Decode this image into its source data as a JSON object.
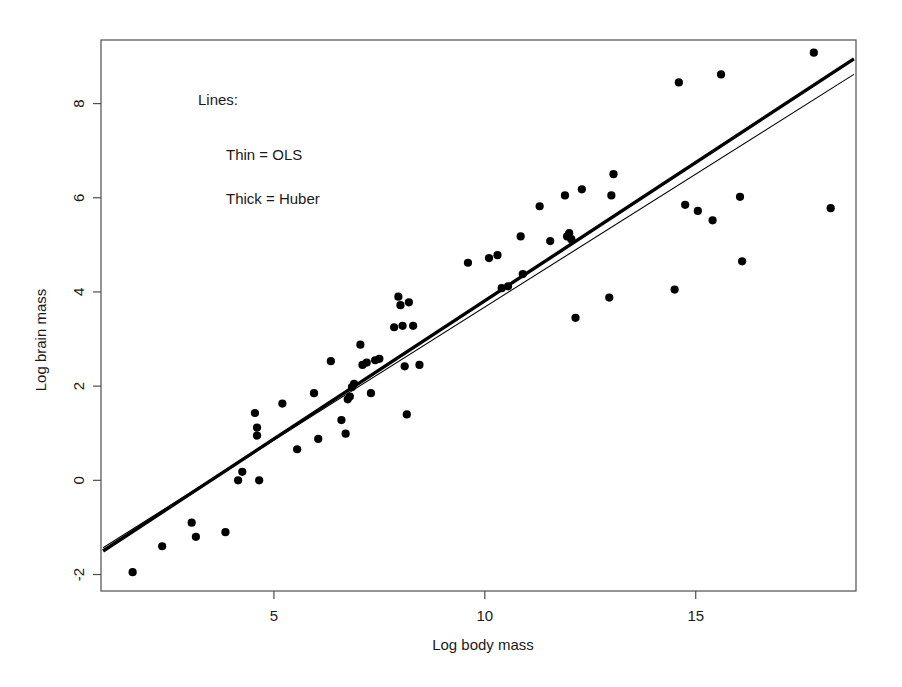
{
  "figure": {
    "background_color": "#ffffff",
    "frame_color": "#4d4d4d",
    "point_color": "#000000",
    "line_color": "#000000"
  },
  "annotations": {
    "heading": "Lines:",
    "line_thin": "Thin = OLS",
    "line_thick": "Thick = Huber"
  },
  "chart_data": {
    "type": "scatter",
    "title": "",
    "xlabel": "Log body mass",
    "ylabel": "Log brain mass",
    "xlim": [
      0.9,
      18.8
    ],
    "ylim": [
      -2.35,
      9.35
    ],
    "xticks": [
      5,
      10,
      15
    ],
    "yticks": [
      -2,
      0,
      2,
      4,
      6,
      8
    ],
    "xtick_labels": [
      "5",
      "10",
      "15"
    ],
    "ytick_labels": [
      "-2",
      "0",
      "2",
      "4",
      "6",
      "8"
    ],
    "grid": false,
    "legend": "annotation-text-upper-left",
    "point_marker": "filled-circle",
    "n_points": 62,
    "x": [
      1.65,
      2.35,
      3.05,
      3.15,
      3.85,
      4.15,
      4.25,
      4.55,
      4.6,
      4.6,
      4.65,
      5.2,
      5.55,
      5.95,
      6.05,
      6.35,
      6.6,
      6.7,
      6.75,
      6.8,
      6.85,
      6.9,
      7.05,
      7.1,
      7.2,
      7.3,
      7.4,
      7.5,
      7.85,
      7.95,
      8.0,
      8.05,
      8.1,
      8.15,
      8.2,
      8.3,
      8.45,
      9.6,
      10.1,
      10.3,
      10.4,
      10.55,
      10.85,
      10.9,
      11.3,
      11.55,
      11.9,
      11.95,
      12.0,
      12.05,
      12.15,
      12.3,
      12.95,
      13.0,
      13.05,
      14.5,
      14.6,
      14.75,
      15.05,
      15.4,
      15.6,
      16.05,
      16.1,
      17.8,
      18.2
    ],
    "y": [
      -1.95,
      -1.4,
      -0.9,
      -1.2,
      -1.1,
      0.0,
      0.18,
      1.43,
      0.95,
      1.12,
      0.0,
      1.63,
      0.66,
      1.85,
      0.88,
      2.53,
      1.28,
      0.99,
      1.72,
      1.78,
      1.98,
      2.05,
      2.88,
      2.45,
      2.5,
      1.85,
      2.55,
      2.58,
      3.25,
      3.9,
      3.72,
      3.28,
      2.42,
      1.4,
      3.78,
      3.28,
      2.45,
      4.62,
      4.72,
      4.78,
      4.08,
      4.12,
      5.18,
      4.38,
      5.82,
      5.08,
      6.05,
      5.18,
      5.25,
      5.12,
      3.45,
      6.18,
      3.88,
      6.05,
      6.5,
      4.05,
      8.45,
      5.85,
      5.72,
      5.52,
      8.62,
      6.02,
      4.65,
      9.08,
      5.78
    ],
    "fits": [
      {
        "name": "OLS",
        "style": "thin",
        "endpoints": [
          {
            "x": 0.95,
            "y": -1.43
          },
          {
            "x": 18.75,
            "y": 8.62
          }
        ]
      },
      {
        "name": "Huber",
        "style": "thick",
        "endpoints": [
          {
            "x": 0.95,
            "y": -1.5
          },
          {
            "x": 18.75,
            "y": 8.95
          }
        ]
      }
    ]
  }
}
